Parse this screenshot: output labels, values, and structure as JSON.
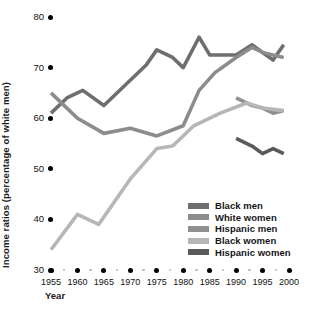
{
  "chart_data": {
    "type": "line",
    "title": "",
    "xlabel": "Year",
    "ylabel": "Income ratios (percentage of white men)",
    "xlim": [
      1955,
      2000
    ],
    "ylim": [
      30,
      80
    ],
    "yticks": [
      80,
      70,
      60,
      50,
      40,
      30
    ],
    "xticks": [
      1955,
      1960,
      1965,
      1970,
      1975,
      1980,
      1985,
      1990,
      1995,
      2000
    ],
    "grid": false,
    "legend_position": "lower-right",
    "series": [
      {
        "name": "Black men",
        "color": "#6e6e6e",
        "x": [
          1955,
          1958,
          1961,
          1965,
          1969,
          1973,
          1975,
          1978,
          1980,
          1983,
          1985,
          1990,
          1993,
          1995,
          1997,
          1999
        ],
        "values": [
          61.0,
          64.0,
          65.5,
          62.5,
          66.5,
          70.5,
          73.5,
          72.0,
          70.0,
          76.0,
          72.5,
          72.5,
          74.5,
          73.0,
          71.5,
          74.5
        ]
      },
      {
        "name": "White women",
        "color": "#8c8c8c",
        "x": [
          1955,
          1960,
          1965,
          1970,
          1975,
          1980,
          1983,
          1986,
          1990,
          1993,
          1995,
          1999
        ],
        "values": [
          65.0,
          60.0,
          57.0,
          58.0,
          56.5,
          58.5,
          65.5,
          69.0,
          72.0,
          74.0,
          73.0,
          72.0
        ]
      },
      {
        "name": "Hispanic men",
        "color": "#8f8f8f",
        "x": [
          1990,
          1993,
          1995,
          1997,
          1999
        ],
        "values": [
          64.0,
          62.5,
          62.0,
          61.0,
          61.5
        ]
      },
      {
        "name": "Black women",
        "color": "#b6b6b6",
        "x": [
          1955,
          1960,
          1964,
          1970,
          1975,
          1978,
          1982,
          1987,
          1992,
          1995,
          1999
        ],
        "values": [
          34.0,
          41.0,
          39.0,
          48.0,
          54.0,
          54.5,
          58.5,
          61.0,
          63.0,
          62.0,
          61.5
        ]
      },
      {
        "name": "Hispanic women",
        "color": "#5a5a5a",
        "x": [
          1990,
          1993,
          1995,
          1997,
          1999
        ],
        "values": [
          56.0,
          54.5,
          53.0,
          54.0,
          53.0
        ]
      }
    ]
  },
  "axes": {
    "ylabel_text": "Income ratios (percentage of white men)",
    "xlabel_text": "Year",
    "ytick_labels": [
      "80",
      "70",
      "60",
      "50",
      "40",
      "30"
    ],
    "xtick_labels": [
      "1955",
      "1960",
      "1965",
      "1970",
      "1975",
      "1980",
      "1985",
      "1990",
      "1995",
      "2000"
    ]
  },
  "legend": {
    "items": [
      {
        "label": "Black men",
        "color": "#6e6e6e"
      },
      {
        "label": "White women",
        "color": "#8c8c8c"
      },
      {
        "label": "Hispanic men",
        "color": "#8f8f8f"
      },
      {
        "label": "Black women",
        "color": "#b6b6b6"
      },
      {
        "label": "Hispanic women",
        "color": "#5a5a5a"
      }
    ]
  }
}
